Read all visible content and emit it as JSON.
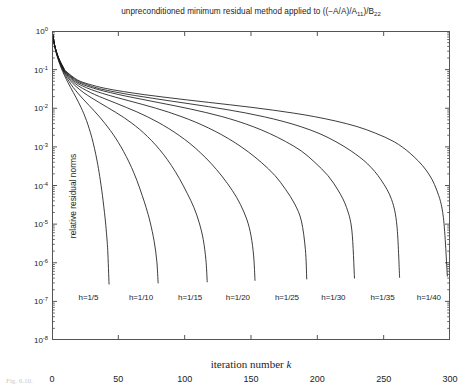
{
  "figure": {
    "caption_partial": "Fig. 6.10.",
    "background": "#ffffff",
    "line_color": "#1a1a1a",
    "axis_color": "#555555"
  },
  "chart_data": {
    "type": "line",
    "title": "unpreconditioned minimum residual method applied to ((−A/A)/A11)/B22",
    "title_parts": {
      "main": "unpreconditioned minimum residual method applied to ((−A/A)/A",
      "sub1": "11",
      "mid": ")/B",
      "sub2": "22"
    },
    "xlabel": "iteration number k",
    "xlabel_text": "iteration number ",
    "xlabel_italic": "k",
    "ylabel": "relative residual norms",
    "xlim": [
      0,
      300
    ],
    "ylim": [
      1e-08,
      1
    ],
    "yscale": "log",
    "xscale": "linear",
    "grid": false,
    "legend": "inline-curve-labels",
    "xticks": [
      0,
      50,
      100,
      150,
      200,
      250,
      300
    ],
    "xtick_labels": [
      "0",
      "50",
      "100",
      "150",
      "200",
      "250",
      "300"
    ],
    "yticks": [
      1,
      0.1,
      0.01,
      0.001,
      0.0001,
      1e-05,
      1e-06,
      1e-07,
      1e-08
    ],
    "ytick_labels": [
      "10 0",
      "10 -1",
      "10 -2",
      "10 -3",
      "10 -4",
      "10 -5",
      "10 -6",
      "10 -7",
      "10 -8"
    ],
    "ytick_exponents": [
      "0",
      "-1",
      "-2",
      "-3",
      "-4",
      "-5",
      "-6",
      "-7",
      "-8"
    ],
    "ytick_mantissa": "10",
    "series": [
      {
        "name": "h=1/5",
        "label": "h=1/5",
        "label_x": 20,
        "label_y": 1.2e-07,
        "end_iteration": 43,
        "points": [
          [
            0,
            1.0
          ],
          [
            1,
            0.62
          ],
          [
            2,
            0.4
          ],
          [
            3,
            0.285
          ],
          [
            4,
            0.215
          ],
          [
            5,
            0.168
          ],
          [
            6,
            0.134
          ],
          [
            7,
            0.109
          ],
          [
            8,
            0.09
          ],
          [
            9,
            0.0755
          ],
          [
            10,
            0.0638
          ],
          [
            12,
            0.0465
          ],
          [
            14,
            0.0345
          ],
          [
            16,
            0.0258
          ],
          [
            18,
            0.0193
          ],
          [
            20,
            0.0143
          ],
          [
            22,
            0.0103
          ],
          [
            24,
            0.0072
          ],
          [
            26,
            0.0048
          ],
          [
            28,
            0.003
          ],
          [
            30,
            0.00175
          ],
          [
            32,
            0.00092
          ],
          [
            34,
            0.00043
          ],
          [
            36,
            0.00017
          ],
          [
            38,
            5.6e-05
          ],
          [
            40,
            1.45e-05
          ],
          [
            41,
            6.2e-06
          ],
          [
            42,
            2.1e-06
          ],
          [
            43,
            2.8e-07
          ]
        ]
      },
      {
        "name": "h=1/10",
        "label": "h=1/10",
        "label_x": 58,
        "label_y": 1.2e-07,
        "end_iteration": 80,
        "points": [
          [
            0,
            1.0
          ],
          [
            1,
            0.63
          ],
          [
            2,
            0.41
          ],
          [
            3,
            0.295
          ],
          [
            4,
            0.224
          ],
          [
            5,
            0.177
          ],
          [
            6,
            0.143
          ],
          [
            7,
            0.118
          ],
          [
            8,
            0.0985
          ],
          [
            9,
            0.0835
          ],
          [
            10,
            0.0715
          ],
          [
            13,
            0.0485
          ],
          [
            16,
            0.0345
          ],
          [
            20,
            0.0235
          ],
          [
            24,
            0.0165
          ],
          [
            28,
            0.0118
          ],
          [
            32,
            0.0084
          ],
          [
            36,
            0.0059
          ],
          [
            40,
            0.004
          ],
          [
            44,
            0.00265
          ],
          [
            48,
            0.00168
          ],
          [
            52,
            0.001
          ],
          [
            56,
            0.00056
          ],
          [
            60,
            0.00029
          ],
          [
            64,
            0.000135
          ],
          [
            68,
            5.5e-05
          ],
          [
            71,
            2.65e-05
          ],
          [
            74,
            1.12e-05
          ],
          [
            77,
            3.6e-06
          ],
          [
            79,
            1.1e-06
          ],
          [
            80,
            3e-07
          ]
        ]
      },
      {
        "name": "h=1/15",
        "label": "h=1/15",
        "label_x": 95,
        "label_y": 1.2e-07,
        "end_iteration": 117,
        "points": [
          [
            0,
            1.0
          ],
          [
            1,
            0.635
          ],
          [
            2,
            0.418
          ],
          [
            3,
            0.302
          ],
          [
            4,
            0.231
          ],
          [
            5,
            0.184
          ],
          [
            6,
            0.15
          ],
          [
            7,
            0.125
          ],
          [
            8,
            0.105
          ],
          [
            9,
            0.09
          ],
          [
            10,
            0.0778
          ],
          [
            14,
            0.0512
          ],
          [
            18,
            0.0368
          ],
          [
            24,
            0.0252
          ],
          [
            30,
            0.0184
          ],
          [
            36,
            0.0138
          ],
          [
            42,
            0.0104
          ],
          [
            48,
            0.00785
          ],
          [
            54,
            0.0058
          ],
          [
            60,
            0.00415
          ],
          [
            66,
            0.00285
          ],
          [
            72,
            0.00185
          ],
          [
            78,
            0.00113
          ],
          [
            84,
            0.00064
          ],
          [
            90,
            0.00033
          ],
          [
            96,
            0.000152
          ],
          [
            102,
            6.2e-05
          ],
          [
            107,
            2.68e-05
          ],
          [
            111,
            1.08e-05
          ],
          [
            114,
            4e-06
          ],
          [
            116,
            1.2e-06
          ],
          [
            117,
            3.2e-07
          ]
        ]
      },
      {
        "name": "h=1/20",
        "label": "h=1/20",
        "label_x": 131,
        "label_y": 1.2e-07,
        "end_iteration": 153,
        "points": [
          [
            0,
            1.0
          ],
          [
            1,
            0.638
          ],
          [
            2,
            0.422
          ],
          [
            3,
            0.307
          ],
          [
            4,
            0.236
          ],
          [
            5,
            0.189
          ],
          [
            6,
            0.156
          ],
          [
            7,
            0.13
          ],
          [
            8,
            0.11
          ],
          [
            9,
            0.0948
          ],
          [
            10,
            0.0824
          ],
          [
            15,
            0.052
          ],
          [
            20,
            0.0378
          ],
          [
            26,
            0.0288
          ],
          [
            32,
            0.0228
          ],
          [
            40,
            0.0175
          ],
          [
            48,
            0.0136
          ],
          [
            56,
            0.0105
          ],
          [
            64,
            0.00805
          ],
          [
            72,
            0.006
          ],
          [
            80,
            0.00432
          ],
          [
            88,
            0.00298
          ],
          [
            96,
            0.00196
          ],
          [
            104,
            0.00122
          ],
          [
            112,
            0.0007
          ],
          [
            120,
            0.00037
          ],
          [
            128,
            0.000176
          ],
          [
            136,
            7.35e-05
          ],
          [
            142,
            3.25e-05
          ],
          [
            147,
            1.28e-05
          ],
          [
            150,
            5e-06
          ],
          [
            152,
            1.5e-06
          ],
          [
            153,
            3.5e-07
          ]
        ]
      },
      {
        "name": "h=1/25",
        "label": "h=1/25",
        "label_x": 168,
        "label_y": 1.2e-07,
        "end_iteration": 192,
        "points": [
          [
            0,
            1.0
          ],
          [
            1,
            0.64
          ],
          [
            2,
            0.425
          ],
          [
            3,
            0.311
          ],
          [
            4,
            0.24
          ],
          [
            5,
            0.193
          ],
          [
            6,
            0.16
          ],
          [
            7,
            0.134
          ],
          [
            8,
            0.114
          ],
          [
            9,
            0.0985
          ],
          [
            10,
            0.086
          ],
          [
            16,
            0.0528
          ],
          [
            22,
            0.0392
          ],
          [
            30,
            0.03
          ],
          [
            38,
            0.0243
          ],
          [
            48,
            0.0193
          ],
          [
            58,
            0.0156
          ],
          [
            68,
            0.0126
          ],
          [
            78,
            0.0101
          ],
          [
            88,
            0.0079
          ],
          [
            98,
            0.006
          ],
          [
            108,
            0.0044
          ],
          [
            118,
            0.00308
          ],
          [
            128,
            0.00205
          ],
          [
            138,
            0.00128
          ],
          [
            148,
            0.00074
          ],
          [
            158,
            0.00039
          ],
          [
            168,
            0.000182
          ],
          [
            176,
            8e-05
          ],
          [
            183,
            3.3e-05
          ],
          [
            188,
            1.2e-05
          ],
          [
            191,
            2.2e-06
          ],
          [
            192,
            3.8e-07
          ]
        ]
      },
      {
        "name": "h=1/30",
        "label": "h=1/30",
        "label_x": 203,
        "label_y": 1.2e-07,
        "end_iteration": 228,
        "points": [
          [
            0,
            1.0
          ],
          [
            1,
            0.642
          ],
          [
            2,
            0.428
          ],
          [
            3,
            0.314
          ],
          [
            4,
            0.243
          ],
          [
            5,
            0.196
          ],
          [
            6,
            0.163
          ],
          [
            7,
            0.138
          ],
          [
            8,
            0.118
          ],
          [
            9,
            0.102
          ],
          [
            10,
            0.089
          ],
          [
            17,
            0.0535
          ],
          [
            24,
            0.0402
          ],
          [
            34,
            0.031
          ],
          [
            44,
            0.0254
          ],
          [
            56,
            0.0205
          ],
          [
            68,
            0.017
          ],
          [
            80,
            0.0141
          ],
          [
            92,
            0.0117
          ],
          [
            104,
            0.0096
          ],
          [
            116,
            0.00775
          ],
          [
            128,
            0.0061
          ],
          [
            140,
            0.0046
          ],
          [
            152,
            0.0033
          ],
          [
            164,
            0.00222
          ],
          [
            176,
            0.00138
          ],
          [
            188,
            0.00078
          ],
          [
            198,
            0.0004
          ],
          [
            208,
            0.00018
          ],
          [
            216,
            7.2e-05
          ],
          [
            222,
            2.7e-05
          ],
          [
            226,
            7e-06
          ],
          [
            228,
            4e-07
          ]
        ]
      },
      {
        "name": "h=1/35",
        "label": "h=1/35",
        "label_x": 240,
        "label_y": 1.2e-07,
        "end_iteration": 262,
        "points": [
          [
            0,
            1.0
          ],
          [
            1,
            0.644
          ],
          [
            2,
            0.43
          ],
          [
            3,
            0.317
          ],
          [
            4,
            0.246
          ],
          [
            5,
            0.199
          ],
          [
            6,
            0.166
          ],
          [
            7,
            0.141
          ],
          [
            8,
            0.121
          ],
          [
            9,
            0.105
          ],
          [
            10,
            0.0915
          ],
          [
            18,
            0.054
          ],
          [
            26,
            0.041
          ],
          [
            36,
            0.032
          ],
          [
            48,
            0.0262
          ],
          [
            62,
            0.0215
          ],
          [
            76,
            0.0181
          ],
          [
            90,
            0.0153
          ],
          [
            104,
            0.013
          ],
          [
            118,
            0.011
          ],
          [
            132,
            0.0092
          ],
          [
            146,
            0.00755
          ],
          [
            160,
            0.006
          ],
          [
            174,
            0.00458
          ],
          [
            188,
            0.0033
          ],
          [
            202,
            0.00218
          ],
          [
            214,
            0.00136
          ],
          [
            226,
            0.00076
          ],
          [
            238,
            0.00036
          ],
          [
            248,
            0.00014
          ],
          [
            256,
            4.3e-05
          ],
          [
            260,
            9e-06
          ],
          [
            262,
            4.2e-07
          ]
        ]
      },
      {
        "name": "h=1/40",
        "label": "h=1/40",
        "label_x": 275,
        "label_y": 1.2e-07,
        "end_iteration": 298,
        "points": [
          [
            0,
            1.0
          ],
          [
            1,
            0.646
          ],
          [
            2,
            0.432
          ],
          [
            3,
            0.319
          ],
          [
            4,
            0.249
          ],
          [
            5,
            0.202
          ],
          [
            6,
            0.169
          ],
          [
            7,
            0.144
          ],
          [
            8,
            0.124
          ],
          [
            9,
            0.108
          ],
          [
            10,
            0.094
          ],
          [
            19,
            0.0545
          ],
          [
            28,
            0.0418
          ],
          [
            40,
            0.0328
          ],
          [
            54,
            0.027
          ],
          [
            70,
            0.0224
          ],
          [
            86,
            0.0191
          ],
          [
            102,
            0.0164
          ],
          [
            118,
            0.0142
          ],
          [
            134,
            0.0123
          ],
          [
            150,
            0.0106
          ],
          [
            166,
            0.009
          ],
          [
            182,
            0.0075
          ],
          [
            198,
            0.00605
          ],
          [
            214,
            0.00465
          ],
          [
            230,
            0.00335
          ],
          [
            244,
            0.00225
          ],
          [
            258,
            0.00135
          ],
          [
            270,
            0.00068
          ],
          [
            282,
            0.00025
          ],
          [
            290,
            7.6e-05
          ],
          [
            295,
            1.5e-05
          ],
          [
            298,
            4.5e-07
          ]
        ]
      }
    ]
  }
}
